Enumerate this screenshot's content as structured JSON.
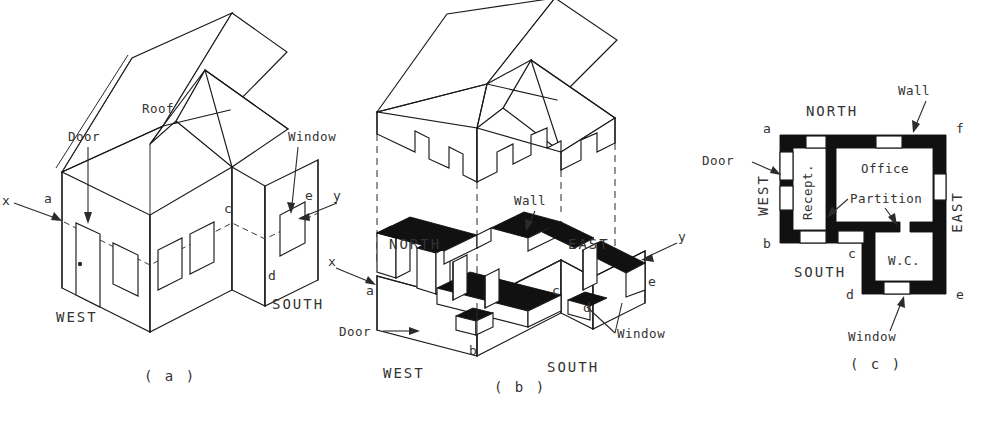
{
  "figure": {
    "ink_color": "#1a1a1a",
    "wall_fill": "#111111",
    "background": "#ffffff"
  },
  "panel_a": {
    "caption": "( a )",
    "labels": {
      "door": "Door",
      "roof": "Roof",
      "window": "Window",
      "west": "WEST",
      "south": "SOUTH"
    },
    "axes": {
      "x": "x",
      "y": "y"
    },
    "points": {
      "a": "a",
      "c": "c",
      "d": "d",
      "e": "e"
    }
  },
  "panel_b": {
    "caption": "( b )",
    "labels": {
      "wall": "Wall",
      "door": "Door",
      "window": "Window",
      "north": "NORTH",
      "east": "EAST",
      "west": "WEST",
      "south": "SOUTH"
    },
    "axes": {
      "x": "x",
      "y": "y"
    },
    "points": {
      "a": "a",
      "b": "b",
      "c": "c",
      "d": "d",
      "e": "e"
    }
  },
  "panel_c": {
    "caption": "( c )",
    "labels": {
      "wall": "Wall",
      "door": "Door",
      "window": "Window",
      "partition": "Partition",
      "north": "NORTH",
      "south": "SOUTH",
      "west": "WEST",
      "east": "EAST"
    },
    "rooms": {
      "reception": "Recept.",
      "office": "Office",
      "wc": "W.C."
    },
    "points": {
      "a": "a",
      "b": "b",
      "c": "c",
      "d": "d",
      "e": "e",
      "f": "f"
    }
  }
}
